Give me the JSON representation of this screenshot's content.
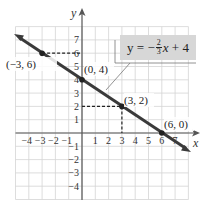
{
  "chart_data": {
    "type": "line",
    "title": "",
    "xlabel": "x",
    "ylabel": "y",
    "xlim": [
      -5,
      8
    ],
    "ylim": [
      -5,
      8
    ],
    "grid": true,
    "x_ticks": [
      "−4",
      "−3",
      "−2",
      "−1",
      "1",
      "2",
      "3",
      "4",
      "5",
      "6",
      "7"
    ],
    "y_ticks": [
      "7",
      "6",
      "5",
      "4",
      "3",
      "2",
      "1",
      "−1",
      "−2",
      "−3",
      "−4"
    ],
    "series": [
      {
        "name": "y = −(2/3)x + 4",
        "slope": -0.6667,
        "intercept": 4,
        "x": [
          -5,
          8.1
        ],
        "y": [
          7.33,
          -1.4
        ]
      }
    ],
    "points": [
      {
        "label": "(−3, 6)",
        "x": -3,
        "y": 6
      },
      {
        "label": "(0, 4)",
        "x": 0,
        "y": 4
      },
      {
        "label": "(3, 2)",
        "x": 3,
        "y": 2
      },
      {
        "label": "(6, 0)",
        "x": 6,
        "y": 0
      }
    ],
    "annotation": {
      "equation_prefix": "y = −",
      "frac_num": "2",
      "frac_den": "3",
      "equation_suffix_var": "x",
      "equation_suffix": " + 4"
    },
    "colors": {
      "line": "#3a3a3a",
      "grid": "#d0d0d0",
      "axis": "#555555",
      "label_box": "#d7d7d7"
    }
  }
}
